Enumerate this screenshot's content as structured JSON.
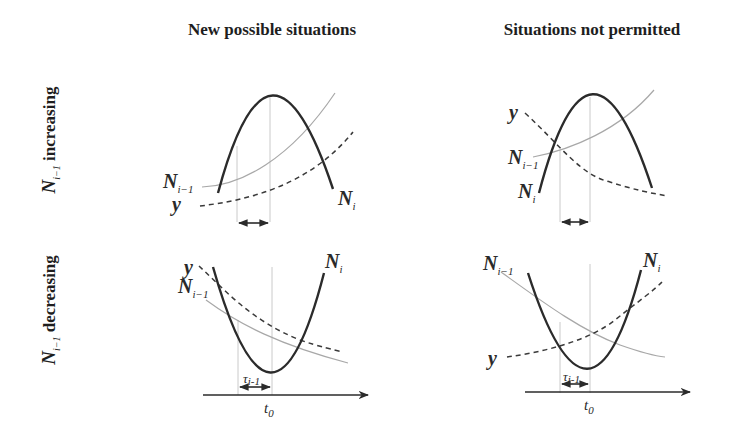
{
  "columns": {
    "left_title": "New possible situations",
    "right_title": "Situations not permitted"
  },
  "rows": {
    "top": {
      "symbol": "N",
      "subscript": "i−1",
      "word": " increasing"
    },
    "bottom": {
      "symbol": "N",
      "subscript": "i−1",
      "word": " decreasing"
    }
  },
  "labels": {
    "N": "N",
    "sub_i": "i",
    "sub_i_minus_1": "i−1",
    "y": "y",
    "tau": "τ",
    "tau_sub": "i-1",
    "t": "t",
    "t_sub": "0"
  },
  "panels": [
    {
      "id": "top-left",
      "row": "N_{i-1} increasing",
      "column": "New possible situations",
      "N_i_shape": "inverted parabola",
      "N_i_minus_1_trend": "increasing",
      "y_trend": "increasing"
    },
    {
      "id": "top-right",
      "row": "N_{i-1} increasing",
      "column": "Situations not permitted",
      "N_i_shape": "inverted parabola",
      "N_i_minus_1_trend": "increasing",
      "y_trend": "decreasing"
    },
    {
      "id": "bottom-left",
      "row": "N_{i-1} decreasing",
      "column": "New possible situations",
      "N_i_shape": "parabola",
      "N_i_minus_1_trend": "decreasing",
      "y_trend": "decreasing",
      "interval_label": "τ_{i-1}",
      "axis_label": "t_0"
    },
    {
      "id": "bottom-right",
      "row": "N_{i-1} decreasing",
      "column": "Situations not permitted",
      "N_i_shape": "parabola",
      "N_i_minus_1_trend": "decreasing",
      "y_trend": "increasing",
      "interval_label": "τ_{i-1}",
      "axis_label": "t_0"
    }
  ],
  "colors": {
    "curve_Ni": "#2b2b2b",
    "curve_Ni_minus_1": "#a8a8a8",
    "curve_y": "#3a3a3a",
    "guide": "#bdbdbd",
    "text": "#1e1e1e"
  }
}
